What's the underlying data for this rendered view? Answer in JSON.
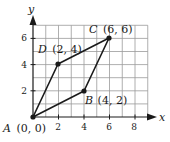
{
  "figure": {
    "axes": {
      "x_label": "x",
      "y_label": "y",
      "x_ticks": [
        "2",
        "4",
        "6",
        "8"
      ],
      "y_ticks": [
        "2",
        "4",
        "6"
      ]
    },
    "points": [
      {
        "letter": "A",
        "coords": "(0, 0)",
        "x": 0,
        "y": 0
      },
      {
        "letter": "B",
        "coords": "(4, 2)",
        "x": 4,
        "y": 2
      },
      {
        "letter": "C",
        "coords": "(6, 6)",
        "x": 6,
        "y": 6
      },
      {
        "letter": "D",
        "coords": "(2, 4)",
        "x": 2,
        "y": 4
      }
    ],
    "colors": {
      "grid": "#9a9a9a",
      "axis": "#1a1a1a",
      "shape": "#1a1a1a"
    }
  },
  "chart_data": {
    "type": "scatter",
    "title": "",
    "xlabel": "x",
    "ylabel": "y",
    "xlim": [
      0,
      9
    ],
    "ylim": [
      0,
      7
    ],
    "grid": true,
    "x_ticks": [
      2,
      4,
      6,
      8
    ],
    "y_ticks": [
      2,
      4,
      6
    ],
    "series": [
      {
        "name": "Parallelogram ABCD",
        "closed": true,
        "points": [
          {
            "label": "A",
            "x": 0,
            "y": 0
          },
          {
            "label": "B",
            "x": 4,
            "y": 2
          },
          {
            "label": "C",
            "x": 6,
            "y": 6
          },
          {
            "label": "D",
            "x": 2,
            "y": 4
          }
        ]
      }
    ],
    "annotations": [
      "A (0, 0)",
      "B (4, 2)",
      "C (6, 6)",
      "D (2, 4)"
    ]
  }
}
